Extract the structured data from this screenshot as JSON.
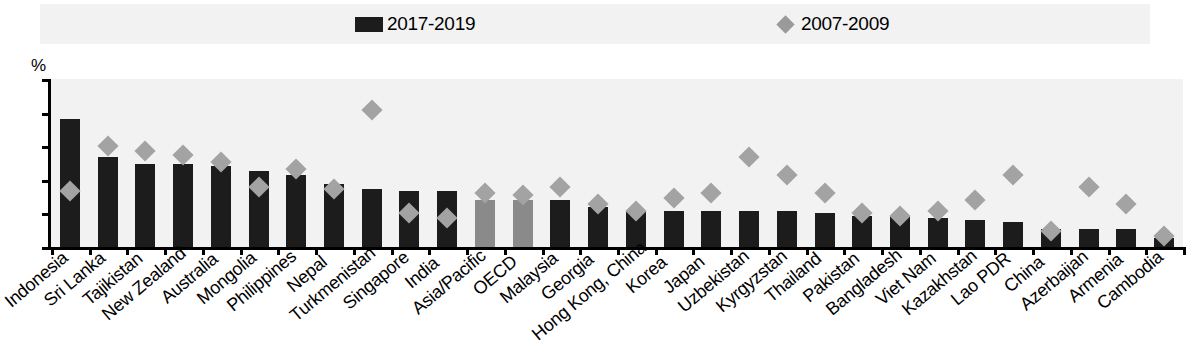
{
  "chart_data": {
    "type": "bar",
    "title": "",
    "subtitle": "",
    "xlabel": "",
    "ylabel": "%",
    "ylim": [
      0,
      75
    ],
    "yticks": [
      0,
      15,
      30,
      45,
      60,
      75
    ],
    "grid": false,
    "legend_position": "top",
    "categories": [
      "Indonesia",
      "Sri Lanka",
      "Tajikistan",
      "New Zealand",
      "Australia",
      "Mongolia",
      "Philippines",
      "Nepal",
      "Turkmenistan",
      "Singapore",
      "India",
      "Asia/Pacific",
      "OECD",
      "Malaysia",
      "Georgia",
      "Hong Kong, China",
      "Korea",
      "Japan",
      "Uzbekistan",
      "Kyrgyzstan",
      "Thailand",
      "Pakistan",
      "Bangladesh",
      "Viet Nam",
      "Kazakhstan",
      "Lao PDR",
      "China",
      "Azerbaijan",
      "Armenia",
      "Cambodia"
    ],
    "aggregate_categories": [
      "Asia/Pacific",
      "OECD"
    ],
    "series": [
      {
        "name": "2017-2019",
        "type": "bar",
        "color": "#1c1c1c",
        "aggregate_color": "#8a8a8a",
        "values": [
          57,
          40,
          37,
          37,
          36,
          34,
          32,
          28,
          26,
          25,
          25,
          21,
          21,
          21,
          18,
          16,
          16,
          16,
          16,
          16,
          15,
          14,
          14,
          13,
          12,
          11,
          8,
          8,
          8,
          4
        ]
      },
      {
        "name": "2007-2009",
        "type": "scatter",
        "marker": "diamond",
        "color": "#a3a3a3",
        "values": [
          25,
          45,
          43,
          41,
          38,
          27,
          35,
          26,
          61,
          15,
          13,
          24,
          23,
          27,
          19,
          16,
          22,
          24,
          40,
          32,
          24,
          15,
          14,
          16,
          21,
          32,
          7,
          27,
          19,
          5
        ]
      }
    ]
  },
  "legend": {
    "items": [
      {
        "label": "2017-2019",
        "marker": "bar-swatch"
      },
      {
        "label": "2007-2009",
        "marker": "diamond-swatch"
      }
    ]
  },
  "axis": {
    "unit": "%",
    "tick_labels": [
      "75",
      "60",
      "45",
      "30",
      "15",
      "0"
    ]
  }
}
